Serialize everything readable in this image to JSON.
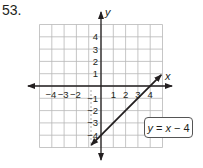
{
  "problem": {
    "number": "53."
  },
  "axes": {
    "x_label": "x",
    "y_label": "y"
  },
  "equation": {
    "text": "y = x − 4",
    "lhs": "y",
    "eq": " = ",
    "var": "x",
    "rest": " − 4"
  },
  "chart_data": {
    "type": "line",
    "title": "",
    "xlabel": "x",
    "ylabel": "y",
    "xlim": [
      -5,
      5
    ],
    "ylim": [
      -5,
      5
    ],
    "grid": true,
    "x_tick_labels": [
      "-4",
      "-3",
      "-2",
      "1",
      "2",
      "3",
      "4"
    ],
    "y_tick_labels": [
      "4",
      "3",
      "2",
      "1",
      "-1",
      "-2",
      "-3",
      "-4"
    ],
    "series": [
      {
        "name": "y = x − 4",
        "x": [
          -0.8,
          4.9
        ],
        "y": [
          -4.8,
          0.9
        ],
        "slope": 1,
        "intercept": -4,
        "arrows": "both"
      }
    ],
    "annotations": [
      "y = x − 4"
    ]
  },
  "ticks": {
    "x": [
      {
        "v": -4,
        "label": "−4"
      },
      {
        "v": -3,
        "label": "−3"
      },
      {
        "v": -2,
        "label": "−2"
      },
      {
        "v": 1,
        "label": "1"
      },
      {
        "v": 2,
        "label": "2"
      },
      {
        "v": 3,
        "label": "3"
      },
      {
        "v": 4,
        "label": "4"
      }
    ],
    "y": [
      {
        "v": 4,
        "label": "4"
      },
      {
        "v": 3,
        "label": "3"
      },
      {
        "v": 2,
        "label": "2"
      },
      {
        "v": 1,
        "label": "1"
      },
      {
        "v": -1,
        "label": "−1"
      },
      {
        "v": -2,
        "label": "−2"
      },
      {
        "v": -3,
        "label": "−3"
      },
      {
        "v": -4,
        "label": "−4"
      }
    ]
  }
}
